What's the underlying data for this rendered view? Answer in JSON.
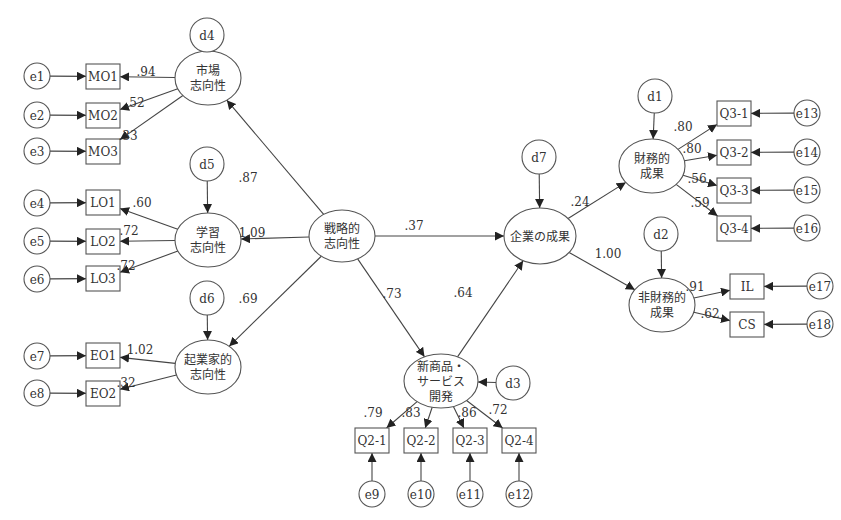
{
  "colors": {
    "line": "#444444",
    "text": "#333333",
    "background": "#ffffff"
  },
  "latents": [
    {
      "id": "MO",
      "lines": [
        "市場",
        "志向性"
      ],
      "cx": 208,
      "cy": 78,
      "rx": 33,
      "ry": 27
    },
    {
      "id": "LO",
      "lines": [
        "学習",
        "志向性"
      ],
      "cx": 208,
      "cy": 240,
      "rx": 33,
      "ry": 27
    },
    {
      "id": "EO",
      "lines": [
        "起業家的",
        "志向性"
      ],
      "cx": 208,
      "cy": 367,
      "rx": 33,
      "ry": 27
    },
    {
      "id": "SO",
      "lines": [
        "戦略的",
        "志向性"
      ],
      "cx": 342,
      "cy": 236,
      "rx": 33,
      "ry": 26
    },
    {
      "id": "PERF",
      "lines": [
        "企業の成果"
      ],
      "cx": 540,
      "cy": 236,
      "rx": 36,
      "ry": 28
    },
    {
      "id": "NPD",
      "lines": [
        "新商品・",
        "サービス",
        "開発"
      ],
      "cx": 441,
      "cy": 381,
      "rx": 37,
      "ry": 27
    },
    {
      "id": "FIN",
      "lines": [
        "財務的",
        "成果"
      ],
      "cx": 652,
      "cy": 166,
      "rx": 33,
      "ry": 27
    },
    {
      "id": "NFIN",
      "lines": [
        "非財務的",
        "成果"
      ],
      "cx": 662,
      "cy": 305,
      "rx": 33,
      "ry": 27
    }
  ],
  "disturbances": [
    {
      "id": "d4",
      "label": "d4",
      "cx": 207,
      "cy": 35,
      "target": "MO",
      "dir": "down"
    },
    {
      "id": "d5",
      "label": "d5",
      "cx": 207,
      "cy": 164,
      "target": "LO",
      "dir": "down"
    },
    {
      "id": "d6",
      "label": "d6",
      "cx": 207,
      "cy": 298,
      "target": "EO",
      "dir": "down"
    },
    {
      "id": "d7",
      "label": "d7",
      "cx": 539,
      "cy": 157,
      "target": "PERF",
      "dir": "down"
    },
    {
      "id": "d1",
      "label": "d1",
      "cx": 655,
      "cy": 96,
      "target": "FIN",
      "dir": "down"
    },
    {
      "id": "d2",
      "label": "d2",
      "cx": 661,
      "cy": 234,
      "target": "NFIN",
      "dir": "down"
    },
    {
      "id": "d3",
      "label": "d3",
      "cx": 513,
      "cy": 383,
      "target": "NPD",
      "dir": "left"
    }
  ],
  "indicators": [
    {
      "label": "MO1",
      "x": 86,
      "y": 64,
      "w": 34,
      "h": 25,
      "error": "e1"
    },
    {
      "label": "MO2",
      "x": 86,
      "y": 103,
      "w": 34,
      "h": 25,
      "error": "e2"
    },
    {
      "label": "MO3",
      "x": 86,
      "y": 139,
      "w": 34,
      "h": 25,
      "error": "e3"
    },
    {
      "label": "LO1",
      "x": 86,
      "y": 190,
      "w": 34,
      "h": 25,
      "error": "e4"
    },
    {
      "label": "LO2",
      "x": 86,
      "y": 229,
      "w": 34,
      "h": 25,
      "error": "e5"
    },
    {
      "label": "LO3",
      "x": 86,
      "y": 266,
      "w": 34,
      "h": 25,
      "error": "e6"
    },
    {
      "label": "EO1",
      "x": 86,
      "y": 343,
      "w": 34,
      "h": 25,
      "error": "e7"
    },
    {
      "label": "EO2",
      "x": 86,
      "y": 381,
      "w": 34,
      "h": 25,
      "error": "e8"
    },
    {
      "label": "Q2-1",
      "x": 355,
      "y": 428,
      "w": 34,
      "h": 25,
      "error": "e9"
    },
    {
      "label": "Q2-2",
      "x": 404,
      "y": 428,
      "w": 34,
      "h": 25,
      "error": "e10"
    },
    {
      "label": "Q2-3",
      "x": 453,
      "y": 428,
      "w": 34,
      "h": 25,
      "error": "e11"
    },
    {
      "label": "Q2-4",
      "x": 502,
      "y": 428,
      "w": 34,
      "h": 25,
      "error": "e12"
    },
    {
      "label": "Q3-1",
      "x": 717,
      "y": 101,
      "w": 34,
      "h": 25,
      "error": "e13"
    },
    {
      "label": "Q3-2",
      "x": 717,
      "y": 140,
      "w": 34,
      "h": 25,
      "error": "e14"
    },
    {
      "label": "Q3-3",
      "x": 717,
      "y": 178,
      "w": 34,
      "h": 25,
      "error": "e15"
    },
    {
      "label": "Q3-4",
      "x": 717,
      "y": 216,
      "w": 34,
      "h": 25,
      "error": "e16"
    },
    {
      "label": "IL",
      "x": 730,
      "y": 274,
      "w": 34,
      "h": 25,
      "error": "e17"
    },
    {
      "label": "CS",
      "x": 730,
      "y": 312,
      "w": 34,
      "h": 25,
      "error": "e18"
    }
  ],
  "errors": [
    {
      "label": "e1",
      "cx": 37,
      "cy": 76
    },
    {
      "label": "e2",
      "cx": 37,
      "cy": 115
    },
    {
      "label": "e3",
      "cx": 37,
      "cy": 151
    },
    {
      "label": "e4",
      "cx": 37,
      "cy": 203
    },
    {
      "label": "e5",
      "cx": 37,
      "cy": 241
    },
    {
      "label": "e6",
      "cx": 37,
      "cy": 279
    },
    {
      "label": "e7",
      "cx": 37,
      "cy": 356
    },
    {
      "label": "e8",
      "cx": 37,
      "cy": 393
    },
    {
      "label": "e9",
      "cx": 372,
      "cy": 494
    },
    {
      "label": "e10",
      "cx": 421,
      "cy": 494
    },
    {
      "label": "e11",
      "cx": 470,
      "cy": 494
    },
    {
      "label": "e12",
      "cx": 519,
      "cy": 494
    },
    {
      "label": "e13",
      "cx": 807,
      "cy": 113
    },
    {
      "label": "e14",
      "cx": 807,
      "cy": 152
    },
    {
      "label": "e15",
      "cx": 807,
      "cy": 190
    },
    {
      "label": "e16",
      "cx": 807,
      "cy": 228
    },
    {
      "label": "e17",
      "cx": 820,
      "cy": 286
    },
    {
      "label": "e18",
      "cx": 820,
      "cy": 324
    }
  ],
  "paths": [
    {
      "from": "SO",
      "to": "MO",
      "coef": ".87",
      "lx": 248,
      "ly": 182
    },
    {
      "from": "SO",
      "to": "LO",
      "coef": "1.09",
      "lx": 252,
      "ly": 237
    },
    {
      "from": "SO",
      "to": "EO",
      "coef": ".69",
      "lx": 248,
      "ly": 303
    },
    {
      "from": "SO",
      "to": "PERF",
      "coef": ".37",
      "lx": 414,
      "ly": 230
    },
    {
      "from": "SO",
      "to": "NPD",
      "coef": ".73",
      "lx": 392,
      "ly": 298
    },
    {
      "from": "NPD",
      "to": "PERF",
      "coef": ".64",
      "lx": 463,
      "ly": 297
    },
    {
      "from": "PERF",
      "to": "FIN",
      "coef": ".24",
      "lx": 580,
      "ly": 206
    },
    {
      "from": "PERF",
      "to": "NFIN",
      "coef": "1.00",
      "lx": 608,
      "ly": 258
    }
  ],
  "loadings": [
    {
      "latent": "MO",
      "indicator": "MO1",
      "coef": ".94",
      "lx": 146,
      "ly": 76
    },
    {
      "latent": "MO",
      "indicator": "MO2",
      "coef": ".52",
      "lx": 135,
      "ly": 107
    },
    {
      "latent": "MO",
      "indicator": "MO3",
      "coef": ".33",
      "lx": 128,
      "ly": 140
    },
    {
      "latent": "LO",
      "indicator": "LO1",
      "coef": ".60",
      "lx": 142,
      "ly": 207
    },
    {
      "latent": "LO",
      "indicator": "LO2",
      "coef": ".72",
      "lx": 129,
      "ly": 235
    },
    {
      "latent": "LO",
      "indicator": "LO3",
      "coef": ".72",
      "lx": 126,
      "ly": 270
    },
    {
      "latent": "EO",
      "indicator": "EO1",
      "coef": "1.02",
      "lx": 140,
      "ly": 354
    },
    {
      "latent": "EO",
      "indicator": "EO2",
      "coef": ".32",
      "lx": 126,
      "ly": 387
    },
    {
      "latent": "NPD",
      "indicator": "Q2-1",
      "coef": ".79",
      "lx": 373,
      "ly": 417
    },
    {
      "latent": "NPD",
      "indicator": "Q2-2",
      "coef": ".83",
      "lx": 411,
      "ly": 417
    },
    {
      "latent": "NPD",
      "indicator": "Q2-3",
      "coef": ".86",
      "lx": 467,
      "ly": 417
    },
    {
      "latent": "NPD",
      "indicator": "Q2-4",
      "coef": ".72",
      "lx": 498,
      "ly": 414
    },
    {
      "latent": "FIN",
      "indicator": "Q3-1",
      "coef": ".80",
      "lx": 683,
      "ly": 131
    },
    {
      "latent": "FIN",
      "indicator": "Q3-2",
      "coef": ".80",
      "lx": 692,
      "ly": 153
    },
    {
      "latent": "FIN",
      "indicator": "Q3-3",
      "coef": ".56",
      "lx": 697,
      "ly": 183
    },
    {
      "latent": "FIN",
      "indicator": "Q3-4",
      "coef": ".59",
      "lx": 700,
      "ly": 207
    },
    {
      "latent": "NFIN",
      "indicator": "IL",
      "coef": ".91",
      "lx": 695,
      "ly": 291
    },
    {
      "latent": "NFIN",
      "indicator": "CS",
      "coef": ".62",
      "lx": 710,
      "ly": 318
    }
  ]
}
